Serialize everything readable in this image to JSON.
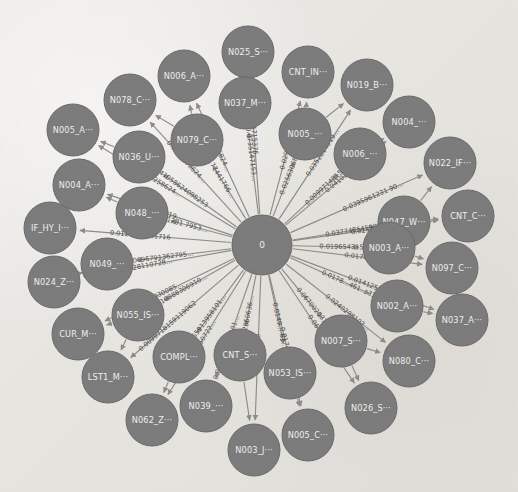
{
  "view": {
    "title": "Directed graph visualization",
    "background_color": "#eceae6",
    "node_fill": "#7c7c7c",
    "node_stroke": "#6a6a6a",
    "node_label_color": "#f0efec",
    "edge_color": "#8e8c88",
    "edge_label_color": "#4a4a48",
    "width": 518,
    "height": 492
  },
  "chart_data": {
    "type": "graph",
    "layout": "radial-star",
    "title": "",
    "hub": {
      "id": "0",
      "label": "0",
      "x": 262,
      "y": 245,
      "r": 30
    },
    "node_radius": 26,
    "nodes": [
      {
        "id": "n1",
        "label": "N025_S···",
        "x": 248,
        "y": 52
      },
      {
        "id": "n2",
        "label": "N006_A···",
        "x": 184,
        "y": 76
      },
      {
        "id": "n3",
        "label": "CNT_IN···",
        "x": 308,
        "y": 72
      },
      {
        "id": "n4",
        "label": "N019_B···",
        "x": 367,
        "y": 85
      },
      {
        "id": "n5",
        "label": "N078_C···",
        "x": 130,
        "y": 100
      },
      {
        "id": "n6",
        "label": "N037_M···",
        "x": 245,
        "y": 103
      },
      {
        "id": "n7",
        "label": "N004_···",
        "x": 409,
        "y": 122
      },
      {
        "id": "n8",
        "label": "N005_A···",
        "x": 73,
        "y": 130
      },
      {
        "id": "n9",
        "label": "N079_C···",
        "x": 197,
        "y": 140
      },
      {
        "id": "n10",
        "label": "N005_···",
        "x": 305,
        "y": 134
      },
      {
        "id": "n11",
        "label": "N006_···",
        "x": 360,
        "y": 154
      },
      {
        "id": "n12",
        "label": "N036_U···",
        "x": 139,
        "y": 157
      },
      {
        "id": "n13",
        "label": "N022_IF···",
        "x": 450,
        "y": 163
      },
      {
        "id": "n14",
        "label": "N004_A···",
        "x": 79,
        "y": 185
      },
      {
        "id": "n15",
        "label": "N047_W···",
        "x": 404,
        "y": 222
      },
      {
        "id": "n16",
        "label": "N048_···",
        "x": 142,
        "y": 213
      },
      {
        "id": "n17",
        "label": "CNT_C···",
        "x": 468,
        "y": 216
      },
      {
        "id": "n18",
        "label": "IF_HY_I···",
        "x": 50,
        "y": 228
      },
      {
        "id": "n19",
        "label": "N003_A···",
        "x": 389,
        "y": 248
      },
      {
        "id": "n20",
        "label": "N049_···",
        "x": 107,
        "y": 264
      },
      {
        "id": "n21",
        "label": "N097_C···",
        "x": 452,
        "y": 268
      },
      {
        "id": "n22",
        "label": "N024_Z···",
        "x": 54,
        "y": 282
      },
      {
        "id": "n23",
        "label": "N002_A···",
        "x": 397,
        "y": 306
      },
      {
        "id": "n24",
        "label": "N055_IS···",
        "x": 138,
        "y": 315
      },
      {
        "id": "n25",
        "label": "N037_A···",
        "x": 462,
        "y": 320
      },
      {
        "id": "n26",
        "label": "CUR_M···",
        "x": 78,
        "y": 334
      },
      {
        "id": "n27",
        "label": "N007_S···",
        "x": 341,
        "y": 341
      },
      {
        "id": "n28",
        "label": "N080_C···",
        "x": 409,
        "y": 361
      },
      {
        "id": "n29",
        "label": "CNT_S···",
        "x": 240,
        "y": 355
      },
      {
        "id": "n30",
        "label": "COMPL···",
        "x": 179,
        "y": 357
      },
      {
        "id": "n31",
        "label": "LST1_M···",
        "x": 108,
        "y": 377
      },
      {
        "id": "n32",
        "label": "N053_IS···",
        "x": 290,
        "y": 373
      },
      {
        "id": "n33",
        "label": "N039_···",
        "x": 206,
        "y": 406
      },
      {
        "id": "n34",
        "label": "N062_Z···",
        "x": 152,
        "y": 420
      },
      {
        "id": "n35",
        "label": "N026_S···",
        "x": 371,
        "y": 408
      },
      {
        "id": "n36",
        "label": "N005_C···",
        "x": 308,
        "y": 435
      },
      {
        "id": "n37",
        "label": "N003_J···",
        "x": 254,
        "y": 450
      }
    ],
    "edges": [
      {
        "source": "0",
        "target": "n1",
        "weight_label": "0.073514715376…"
      },
      {
        "source": "0",
        "target": "n2",
        "weight_label": "0.0141056824…"
      },
      {
        "source": "0",
        "target": "n3",
        "weight_label": "0.0296803515…"
      },
      {
        "source": "0",
        "target": "n4",
        "weight_label": "0.0352814319…"
      },
      {
        "source": "0",
        "target": "n5",
        "weight_label": "0.0141258624…"
      },
      {
        "source": "0",
        "target": "n6",
        "weight_label": "0.0735147153…"
      },
      {
        "source": "0",
        "target": "n7",
        "weight_label": "0.0410292728081…"
      },
      {
        "source": "0",
        "target": "n8",
        "weight_label": "0.0141258624…"
      },
      {
        "source": "0",
        "target": "n9",
        "weight_label": "0.0177441766…"
      },
      {
        "source": "0",
        "target": "n10",
        "weight_label": "0.0256306828…"
      },
      {
        "source": "0",
        "target": "n11",
        "weight_label": "0.0099714815357…"
      },
      {
        "source": "0",
        "target": "n12",
        "weight_label": "0.0141058624098253"
      },
      {
        "source": "0",
        "target": "n13",
        "weight_label": "0.0395961231 90…"
      },
      {
        "source": "0",
        "target": "n14",
        "weight_label": "0.0666319…"
      },
      {
        "source": "0",
        "target": "n15",
        "weight_label": "0.0377485459998…"
      },
      {
        "source": "0",
        "target": "n16",
        "weight_label": "0.01281 7953…"
      },
      {
        "source": "0",
        "target": "n17",
        "weight_label": "0.0157228264…"
      },
      {
        "source": "0",
        "target": "n18",
        "weight_label": "0.0127572981716"
      },
      {
        "source": "0",
        "target": "n19",
        "weight_label": "0.0196543159…"
      },
      {
        "source": "0",
        "target": "n20",
        "weight_label": "0.0096791362795…"
      },
      {
        "source": "0",
        "target": "n21",
        "weight_label": "0.0170111264…"
      },
      {
        "source": "0",
        "target": "n22",
        "weight_label": "0.0397728110728…"
      },
      {
        "source": "0",
        "target": "n23",
        "weight_label": "0.0178…461… 31…"
      },
      {
        "source": "0",
        "target": "n24",
        "weight_label": "0.0110888306910…"
      },
      {
        "source": "0",
        "target": "n25",
        "weight_label": "0.0141254002472…"
      },
      {
        "source": "0",
        "target": "n26",
        "weight_label": "0.0388660030085…"
      },
      {
        "source": "0",
        "target": "n27",
        "weight_label": "0.0670020317…"
      },
      {
        "source": "0",
        "target": "n28",
        "weight_label": "0.0240298102…"
      },
      {
        "source": "0",
        "target": "n29",
        "weight_label": "0.12860636…"
      },
      {
        "source": "0",
        "target": "n30",
        "weight_label": "0.0114365913958101…"
      },
      {
        "source": "0",
        "target": "n31",
        "weight_label": "0.0099718159119062"
      },
      {
        "source": "0",
        "target": "n32",
        "weight_label": "0.0149… 63… 47"
      },
      {
        "source": "0",
        "target": "n33",
        "weight_label": "0.0174170410101…"
      },
      {
        "source": "0",
        "target": "n34",
        "weight_label": "0.0846350722…"
      },
      {
        "source": "0",
        "target": "n35",
        "weight_label": "0.0614918… 8647"
      },
      {
        "source": "0",
        "target": "n36",
        "weight_label": "0.0174 1704…"
      },
      {
        "source": "0",
        "target": "n37",
        "weight_label": "0.0"
      }
    ],
    "chain_edges": [
      {
        "source": "n9",
        "target": "n5"
      },
      {
        "source": "n9",
        "target": "n2"
      },
      {
        "source": "n6",
        "target": "n1"
      },
      {
        "source": "n10",
        "target": "n3"
      },
      {
        "source": "n10",
        "target": "n4"
      },
      {
        "source": "n11",
        "target": "n7"
      },
      {
        "source": "n12",
        "target": "n8"
      },
      {
        "source": "n16",
        "target": "n14"
      },
      {
        "source": "n15",
        "target": "n13"
      },
      {
        "source": "n15",
        "target": "n17"
      },
      {
        "source": "n19",
        "target": "n21"
      },
      {
        "source": "n20",
        "target": "n22"
      },
      {
        "source": "n23",
        "target": "n25"
      },
      {
        "source": "n24",
        "target": "n26"
      },
      {
        "source": "n24",
        "target": "n31"
      },
      {
        "source": "n27",
        "target": "n28"
      },
      {
        "source": "n27",
        "target": "n35"
      },
      {
        "source": "n29",
        "target": "n37"
      },
      {
        "source": "n30",
        "target": "n34"
      },
      {
        "source": "n32",
        "target": "n36"
      }
    ]
  }
}
